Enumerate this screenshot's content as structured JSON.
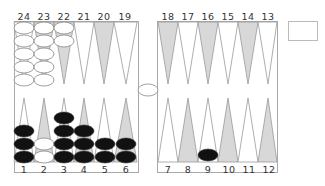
{
  "board": {
    "top_labels": [
      "24",
      "23",
      "22",
      "21",
      "20",
      "19",
      "18",
      "17",
      "16",
      "15",
      "14",
      "13"
    ],
    "bottom_labels": [
      "1",
      "2",
      "3",
      "4",
      "5",
      "6",
      "7",
      "8",
      "9",
      "10",
      "11",
      "12"
    ],
    "colors": {
      "light_point": "#ffffff",
      "dark_point": "#d8d8d8",
      "line": "#999999",
      "white_checker": "#ffffff",
      "black_checker": "#111111"
    },
    "points": {
      "24": {
        "color": "white",
        "count": 5
      },
      "23": {
        "color": "white",
        "count": 5
      },
      "22": {
        "color": "white",
        "count": 2
      },
      "1": {
        "color": "black",
        "count": 3
      },
      "2": {
        "color": "white",
        "count": 2
      },
      "3": {
        "color": "black",
        "count": 4
      },
      "4": {
        "color": "black",
        "count": 3
      },
      "5": {
        "color": "black",
        "count": 2
      },
      "6": {
        "color": "black",
        "count": 2
      },
      "9": {
        "color": "black",
        "count": 1
      }
    },
    "bar": {
      "white": 1,
      "black": 0
    }
  },
  "dice_box": {
    "value": ""
  }
}
